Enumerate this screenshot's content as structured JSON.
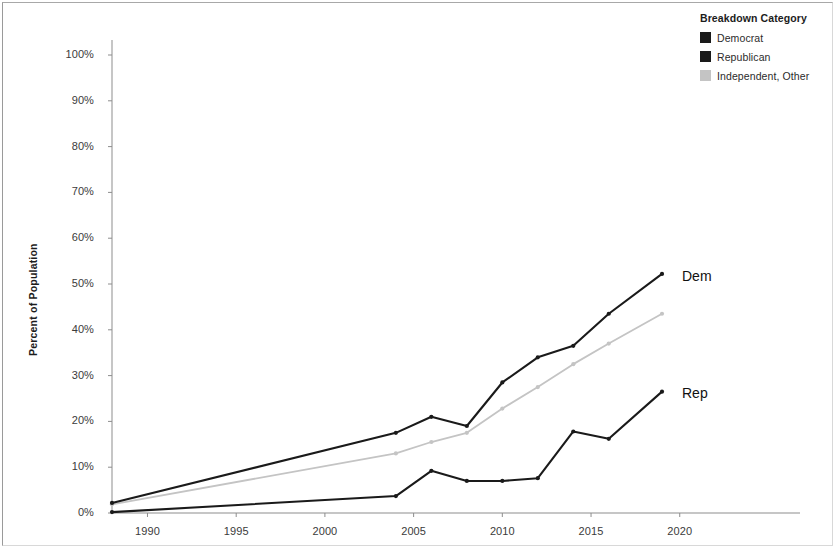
{
  "legend": {
    "title": "Breakdown Category",
    "items": [
      {
        "label": "Democrat",
        "color": "#1a1a1a"
      },
      {
        "label": "Republican",
        "color": "#1a1a1a"
      },
      {
        "label": "Independent, Other",
        "color": "#c4c4c4"
      }
    ]
  },
  "annotations": [
    {
      "text": "Dem",
      "x": 682,
      "y": 268
    },
    {
      "text": "Rep",
      "x": 682,
      "y": 385
    }
  ],
  "chart_data": {
    "type": "line",
    "title": "",
    "xlabel": "",
    "ylabel": "Percent of Population",
    "xlim": [
      1988,
      2021.5
    ],
    "ylim": [
      0,
      100
    ],
    "xticks": [
      1990,
      1995,
      2000,
      2005,
      2010,
      2015,
      2020
    ],
    "xtick_labels": [
      "1990",
      "1995",
      "2000",
      "2005",
      "2010",
      "2015",
      "2020"
    ],
    "yticks": [
      0,
      10,
      20,
      30,
      40,
      50,
      60,
      70,
      80,
      90,
      100
    ],
    "ytick_labels": [
      "0%",
      "10%",
      "20%",
      "30%",
      "40%",
      "50%",
      "60%",
      "70%",
      "80%",
      "90%",
      "100%"
    ],
    "grid": false,
    "legend_position": "top-right",
    "markers": true,
    "series": [
      {
        "name": "Democrat",
        "color": "#1a1a1a",
        "annotation": "Dem",
        "x": [
          1988,
          2004,
          2006,
          2008,
          2010,
          2012,
          2014,
          2016,
          2019
        ],
        "y": [
          2.2,
          17.5,
          21.0,
          19.0,
          28.5,
          34.0,
          36.5,
          43.5,
          52.2
        ]
      },
      {
        "name": "Republican",
        "color": "#1a1a1a",
        "annotation": "Rep",
        "x": [
          1988,
          2004,
          2006,
          2008,
          2010,
          2012,
          2014,
          2016,
          2019
        ],
        "y": [
          0.2,
          3.7,
          9.2,
          7.0,
          7.0,
          7.6,
          17.8,
          16.2,
          26.5
        ]
      },
      {
        "name": "Independent, Other",
        "color": "#c4c4c4",
        "annotation": "",
        "x": [
          1988,
          2004,
          2006,
          2008,
          2010,
          2012,
          2014,
          2016,
          2019
        ],
        "y": [
          1.9,
          13.0,
          15.5,
          17.5,
          22.8,
          27.5,
          32.5,
          37.0,
          43.5
        ]
      }
    ]
  }
}
